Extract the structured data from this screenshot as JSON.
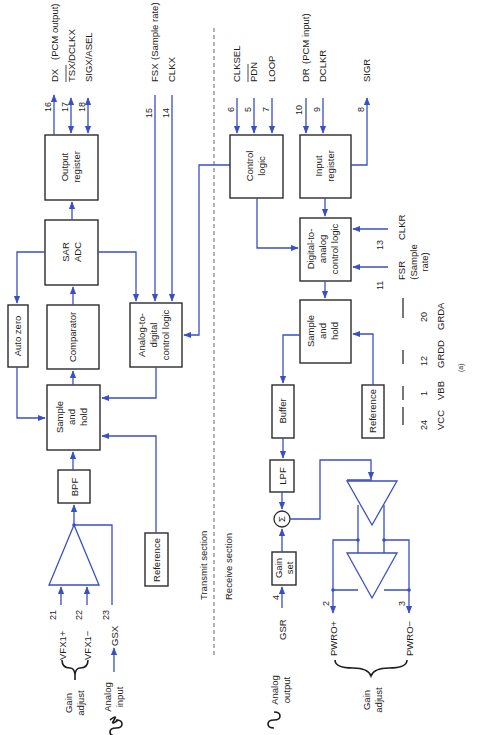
{
  "figure": {
    "label": "(a)",
    "orientation": "rotated 90° counter-clockwise",
    "colors": {
      "wire": "#3a4fc4",
      "box_stroke": "#2b2b2b",
      "text": "#1c1c1c"
    }
  },
  "sections": {
    "transmit": "Transmit section",
    "receive": "Receive section"
  },
  "transmit": {
    "blocks": {
      "output_register": [
        "Output",
        "register"
      ],
      "sar_adc": [
        "SAR",
        "ADC"
      ],
      "auto_zero": "Auto zero",
      "comparator": "Comparator",
      "ad_control": [
        "Analog-to-",
        "digital",
        "control logic"
      ],
      "sample_hold": [
        "Sample",
        "and",
        "hold"
      ],
      "bpf": "BPF",
      "reference": "Reference"
    },
    "pins": [
      {
        "num": "16",
        "name": "DX",
        "note": "(PCM output)"
      },
      {
        "num": "17",
        "name": "TSX/DCLKX",
        "note": ""
      },
      {
        "num": "18",
        "name": "SIGX/ASEL",
        "note": ""
      },
      {
        "num": "15",
        "name": "FSX",
        "note": "(Sample rate)"
      },
      {
        "num": "14",
        "name": "CLKX",
        "note": ""
      },
      {
        "num": "21",
        "name": "VFX1+",
        "note": ""
      },
      {
        "num": "22",
        "name": "VFX1−",
        "note": ""
      },
      {
        "num": "23",
        "name": "GSX",
        "note": ""
      }
    ],
    "gain_adjust": [
      "Gain",
      "adjust"
    ],
    "analog_input": [
      "Analog",
      "input"
    ]
  },
  "receive": {
    "blocks": {
      "control_logic": [
        "Control",
        "logic"
      ],
      "input_register": [
        "Input",
        "register"
      ],
      "da_control": [
        "Digital-to-",
        "analog",
        "control logic"
      ],
      "sample_hold": [
        "Sample",
        "and",
        "hold"
      ],
      "buffer": "Buffer",
      "reference": "Reference",
      "lpf": "LPF",
      "gain_set": [
        "Gain",
        "set"
      ],
      "summer": "Σ"
    },
    "pins": [
      {
        "num": "6",
        "name": "CLKSEL",
        "note": ""
      },
      {
        "num": "5",
        "name": "PDN",
        "note": ""
      },
      {
        "num": "7",
        "name": "LOOP",
        "note": ""
      },
      {
        "num": "10",
        "name": "DR",
        "note": "(PCM input)"
      },
      {
        "num": "9",
        "name": "DCLKR",
        "note": ""
      },
      {
        "num": "8",
        "name": "SIGR",
        "note": ""
      },
      {
        "num": "13",
        "name": "CLKR",
        "note": ""
      },
      {
        "num": "11",
        "name": "FSR",
        "note": ""
      },
      {
        "num": "4",
        "name": "GSR",
        "note": ""
      },
      {
        "num": "2",
        "name": "PWRO+",
        "note": ""
      },
      {
        "num": "3",
        "name": "PWRO−",
        "note": ""
      }
    ],
    "sample_rate_note": [
      "(Sample",
      "rate)"
    ],
    "gain_adjust": [
      "Gain",
      "adjust"
    ],
    "analog_output": [
      "Analog",
      "output"
    ]
  },
  "power_pins": [
    {
      "num": "24",
      "name": "VCC"
    },
    {
      "num": "1",
      "name": "VBB"
    },
    {
      "num": "12",
      "name": "GRDD"
    },
    {
      "num": "20",
      "name": "GRDA"
    }
  ]
}
